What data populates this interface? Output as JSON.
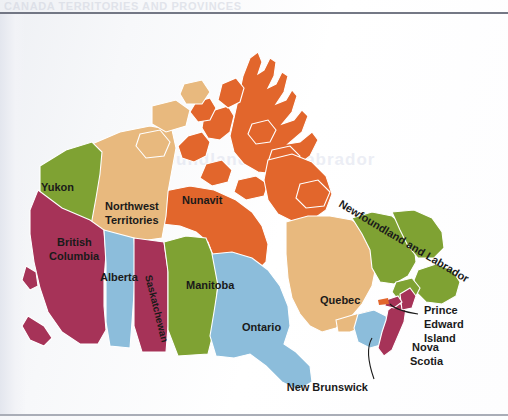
{
  "page": {
    "top_text": "CANADA  TERRITORIES AND PROVINCES",
    "ghost_text": "Newfoundland and Labrador"
  },
  "map": {
    "title": "Map of Canada provinces and territories",
    "colors": {
      "green": "#7FA233",
      "orange": "#E2662C",
      "tan": "#E8B97E",
      "magenta": "#A63358",
      "blue": "#8CBDDB",
      "white": "#FFFFFF",
      "label": "#1A1A1A"
    },
    "regions": [
      {
        "id": "yukon",
        "label": "Yukon",
        "color": "green"
      },
      {
        "id": "northwest-territories",
        "label": "Northwest\nTerritories",
        "line1": "Northwest",
        "line2": "Territories",
        "color": "tan"
      },
      {
        "id": "nunavut",
        "label": "Nunavit",
        "color": "orange"
      },
      {
        "id": "british-columbia",
        "label": "British\nColumbia",
        "line1": "British",
        "line2": "Columbia",
        "color": "magenta"
      },
      {
        "id": "alberta",
        "label": "Alberta",
        "color": "blue"
      },
      {
        "id": "saskatchewan",
        "label": "Saskatchewan",
        "color": "magenta"
      },
      {
        "id": "manitoba",
        "label": "Manitoba",
        "color": "green"
      },
      {
        "id": "ontario",
        "label": "Ontario",
        "color": "blue"
      },
      {
        "id": "quebec",
        "label": "Quebec",
        "color": "tan"
      },
      {
        "id": "newfoundland-and-labrador",
        "label": "Newfoundland and Labrador",
        "color": "green"
      },
      {
        "id": "new-brunswick",
        "label": "New Brunswick",
        "color": "blue"
      },
      {
        "id": "nova-scotia",
        "label": "Nova\nScotia",
        "line1": "Nova",
        "line2": "Scotia",
        "color": "magenta"
      },
      {
        "id": "prince-edward-island",
        "label": "Prince\nEdward\nIsland",
        "line1": "Prince",
        "line2": "Edward",
        "line3": "Island",
        "color": "magenta"
      }
    ]
  }
}
